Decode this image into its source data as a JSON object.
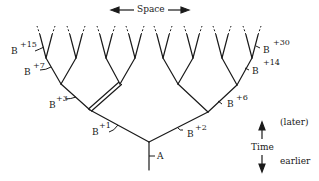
{
  "figure": {
    "space_label": "Space",
    "root_label": "A",
    "time_label": "Time",
    "later_label": "(later)",
    "earlier_label": "earlier",
    "mutation_prefix": "B",
    "mutations": [
      {
        "id": "b1",
        "suffix": "+1"
      },
      {
        "id": "b2",
        "suffix": "+2"
      },
      {
        "id": "b3",
        "suffix": "+3"
      },
      {
        "id": "b6",
        "suffix": "+6"
      },
      {
        "id": "b7",
        "suffix": "+7"
      },
      {
        "id": "b14",
        "suffix": "+14"
      },
      {
        "id": "b15",
        "suffix": "+15"
      },
      {
        "id": "b30",
        "suffix": "+30"
      }
    ]
  },
  "colors": {
    "line": "#1a1a1a",
    "background": "#ffffff"
  }
}
